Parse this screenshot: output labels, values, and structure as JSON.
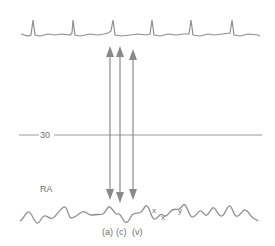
{
  "diagram": {
    "top_trace": {
      "name": "ECG",
      "color": "#8a8a8a"
    },
    "reference_line": {
      "label": "30",
      "color": "#9a9a9a"
    },
    "bottom_trace": {
      "name": "RA",
      "label": "RA",
      "color": "#8a8a8a"
    },
    "arrows": [
      {
        "label": "(a)",
        "x": 110
      },
      {
        "label": "(c)",
        "x": 120
      },
      {
        "label": "(v)",
        "x": 133
      }
    ],
    "wave_labels": {
      "a": "(a)",
      "c": "(c)",
      "v": "(v)",
      "x": "x",
      "x_prime": "x'",
      "y": "y"
    },
    "arrow_color": "#8a8a8a"
  }
}
